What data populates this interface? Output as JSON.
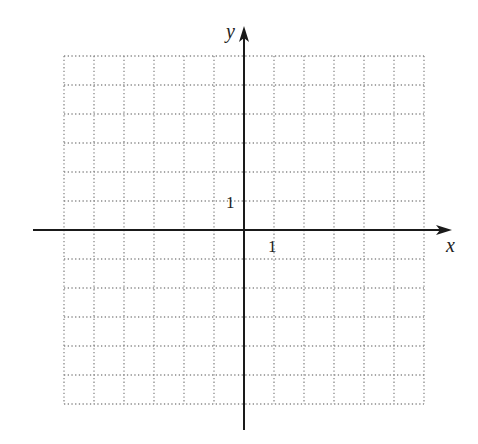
{
  "diagram": {
    "type": "coordinate-grid",
    "grid": {
      "left": 64,
      "top": 56,
      "cols": 12,
      "rows": 12,
      "cell_w": 30,
      "cell_h": 29,
      "color": "#8a8a8a"
    },
    "axes": {
      "origin": {
        "x": 244,
        "y": 230
      },
      "x_axis": {
        "from": 33,
        "to": 452,
        "label": "x"
      },
      "y_axis": {
        "from": 430,
        "to": 26,
        "label": "y"
      },
      "color": "#1a1a1a"
    },
    "tick_labels": {
      "x_unit": "1",
      "y_unit": "1"
    }
  }
}
